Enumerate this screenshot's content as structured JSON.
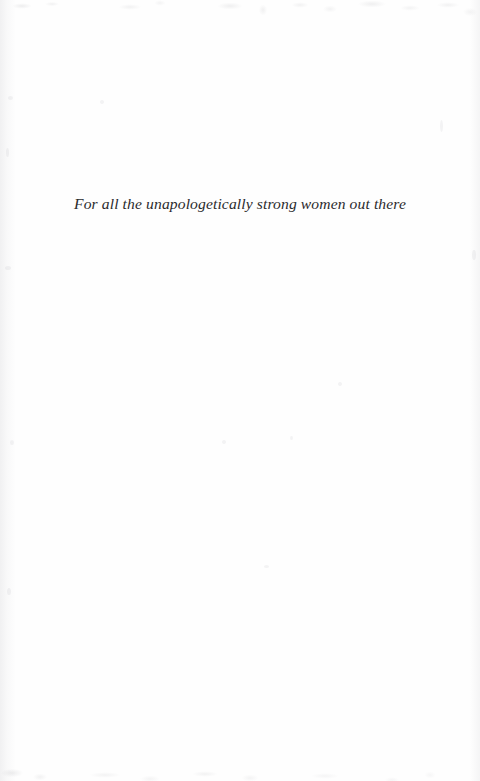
{
  "page": {
    "kind": "book-dedication-page",
    "background_color": "#fefefe",
    "text_color": "#2b2b2d"
  },
  "dedication": {
    "text": "For all the unapologetically strong women out there"
  }
}
